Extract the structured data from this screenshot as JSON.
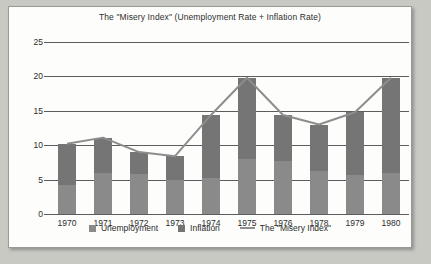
{
  "chart_data": {
    "type": "bar",
    "title": "The \"Misery Index\" (Unemployment Rate + Inflation Rate)",
    "xlabel": "",
    "ylabel": "",
    "ylim": [
      0,
      25
    ],
    "yticks": [
      0,
      5,
      10,
      15,
      20,
      25
    ],
    "grid": true,
    "legend_position": "bottom",
    "stacked": true,
    "categories": [
      "1970",
      "1971",
      "1972",
      "1973",
      "1974",
      "1975",
      "1976",
      "1978",
      "1979",
      "1980"
    ],
    "series": [
      {
        "name": "Unemployment",
        "type": "bar",
        "color": "#8a8a8a",
        "values": [
          4.2,
          5.9,
          5.8,
          5.0,
          5.2,
          8.0,
          7.7,
          6.2,
          5.7,
          6.0
        ]
      },
      {
        "name": "Inflation",
        "type": "bar",
        "color": "#757575",
        "values": [
          6.0,
          5.2,
          3.2,
          3.4,
          9.2,
          11.8,
          6.7,
          6.8,
          9.1,
          13.8
        ]
      },
      {
        "name": "The \"Misery Index\"",
        "type": "line",
        "color": "#8d8d8d",
        "values": [
          10.2,
          11.1,
          9.0,
          8.4,
          14.4,
          19.8,
          14.4,
          13.0,
          14.8,
          19.8
        ]
      }
    ]
  },
  "legend": {
    "items": [
      {
        "label": "Unemployment",
        "marker": "square",
        "color": "#8a8a8a"
      },
      {
        "label": "Inflation",
        "marker": "square",
        "color": "#757575"
      },
      {
        "label": "The \"Misery Index\"",
        "marker": "line",
        "color": "#8d8d8d"
      }
    ]
  }
}
